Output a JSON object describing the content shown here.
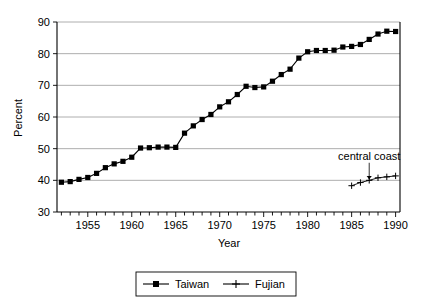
{
  "chart_data": {
    "type": "line",
    "title": "",
    "xlabel": "Year",
    "ylabel": "Percent",
    "xlim": [
      1951.5,
      1990.5
    ],
    "ylim": [
      30,
      90
    ],
    "yticks": [
      30,
      40,
      50,
      60,
      70,
      80,
      90
    ],
    "xticks_major": [
      1955,
      1960,
      1965,
      1970,
      1975,
      1980,
      1985,
      1990
    ],
    "xtick_step_minor": 1,
    "grid": "horizontal",
    "legend_position": "bottom-outside",
    "annotations": [
      {
        "text": "central coast",
        "x": 1987.0,
        "y": 46.5,
        "points_to_series": "Fujian",
        "points_to_x": 1987,
        "points_to_y": 40.0
      }
    ],
    "series": [
      {
        "name": "Taiwan",
        "marker": "filled-square",
        "x": [
          1952,
          1953,
          1954,
          1955,
          1956,
          1957,
          1958,
          1959,
          1960,
          1961,
          1962,
          1963,
          1964,
          1965,
          1966,
          1967,
          1968,
          1969,
          1970,
          1971,
          1972,
          1973,
          1974,
          1975,
          1976,
          1977,
          1978,
          1979,
          1980,
          1981,
          1982,
          1983,
          1984,
          1985,
          1986,
          1987,
          1988,
          1989,
          1990
        ],
        "values": [
          39.4,
          39.6,
          40.3,
          40.9,
          42.2,
          44.0,
          45.2,
          46.0,
          47.3,
          50.2,
          50.3,
          50.5,
          50.5,
          50.4,
          54.9,
          57.2,
          59.2,
          60.8,
          63.2,
          64.8,
          67.1,
          69.7,
          69.3,
          69.5,
          71.3,
          73.4,
          75.1,
          78.6,
          80.6,
          81.0,
          81.0,
          81.1,
          82.1,
          82.3,
          82.9,
          84.5,
          86.2,
          87.1,
          87.0
        ]
      },
      {
        "name": "Fujian",
        "marker": "plus",
        "x": [
          1985,
          1986,
          1987,
          1988,
          1989,
          1990
        ],
        "values": [
          38.3,
          39.3,
          40.0,
          40.8,
          41.1,
          41.4
        ]
      }
    ]
  },
  "axes": {
    "y_label": "Percent",
    "x_label": "Year",
    "y_tick_labels": [
      "30",
      "40",
      "50",
      "60",
      "70",
      "80",
      "90"
    ],
    "x_tick_labels": [
      "1955",
      "1960",
      "1965",
      "1970",
      "1975",
      "1980",
      "1985",
      "1990"
    ]
  },
  "legend": {
    "items": [
      {
        "label": "Taiwan",
        "marker": "filled-square"
      },
      {
        "label": "Fujian",
        "marker": "plus"
      }
    ]
  },
  "annotation": {
    "central_coast": "central coast"
  },
  "colors": {
    "series": "#000000",
    "grid": "#999999",
    "axis": "#000000",
    "background": "#ffffff"
  }
}
